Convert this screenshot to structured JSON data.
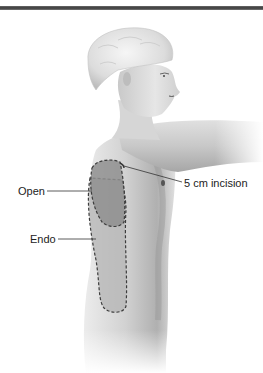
{
  "figure": {
    "type": "medical-illustration",
    "labels": {
      "open": "Open",
      "endo": "Endo",
      "incision": "5 cm incision"
    },
    "colors": {
      "rule": "#3a3a3a",
      "skin_light": "#f2f2f2",
      "skin_mid": "#cfcfcf",
      "skin_dark": "#8c8c8c",
      "open_region": "#9a9a9a",
      "endo_region": "#b4b4b4",
      "dashed_outline": "#3c3c3c",
      "label_text": "#222222"
    }
  }
}
